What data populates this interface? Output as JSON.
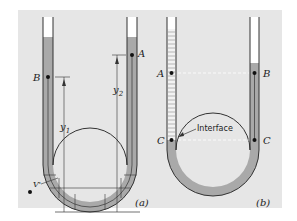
{
  "figure": {
    "background_color": "#e6e6e6",
    "fluid_color": "#a9a9a9",
    "tube_wall_color": "#333333",
    "light_fluid_color": "#f2f2f2"
  },
  "panel_a": {
    "caption": "(a)",
    "point_left": "B",
    "point_right": "A",
    "dim_left": "y",
    "dim_left_sub": "1",
    "dim_right": "y",
    "dim_right_sub": "2",
    "volume_label": "V'"
  },
  "panel_b": {
    "caption": "(b)",
    "point_left_upper": "A",
    "point_right_upper": "B",
    "point_left_lower": "C",
    "point_right_lower": "C",
    "interface_label": "Interface"
  }
}
